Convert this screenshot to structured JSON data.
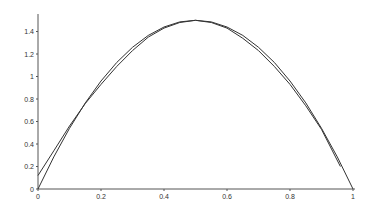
{
  "chart_data": {
    "type": "line",
    "title": "",
    "xlabel": "",
    "ylabel": "",
    "xlim": [
      0,
      1
    ],
    "ylim": [
      0,
      1.55
    ],
    "grid": false,
    "legend": null,
    "x_ticks": [
      "0",
      "0.2",
      "0.4",
      "0.6",
      "0.8",
      "1"
    ],
    "y_ticks": [
      "0",
      "0.2",
      "0.4",
      "0.6",
      "0.8",
      "1",
      "1.2",
      "1.4"
    ],
    "series": [
      {
        "name": "exact",
        "x": [
          0,
          0.05,
          0.1,
          0.15,
          0.2,
          0.25,
          0.3,
          0.35,
          0.4,
          0.45,
          0.5,
          0.55,
          0.6,
          0.65,
          0.7,
          0.75,
          0.8,
          0.85,
          0.9,
          0.95,
          1.0
        ],
        "y": [
          0,
          0.285,
          0.54,
          0.765,
          0.96,
          1.125,
          1.26,
          1.365,
          1.44,
          1.485,
          1.5,
          1.485,
          1.44,
          1.365,
          1.26,
          1.125,
          0.96,
          0.765,
          0.54,
          0.285,
          0
        ]
      },
      {
        "name": "approximation",
        "x": [
          0,
          0.05,
          0.1,
          0.15,
          0.2,
          0.25,
          0.3,
          0.35,
          0.4,
          0.45,
          0.5,
          0.55,
          0.6,
          0.65,
          0.7,
          0.75,
          0.8,
          0.85,
          0.9,
          0.96
        ],
        "y": [
          0.12,
          0.34,
          0.56,
          0.76,
          0.93,
          1.09,
          1.23,
          1.35,
          1.43,
          1.48,
          1.5,
          1.48,
          1.43,
          1.34,
          1.23,
          1.09,
          0.93,
          0.74,
          0.53,
          0.2
        ]
      }
    ]
  },
  "style": {
    "line_color": "#333333",
    "axis_color": "#555555",
    "background": "#ffffff"
  }
}
